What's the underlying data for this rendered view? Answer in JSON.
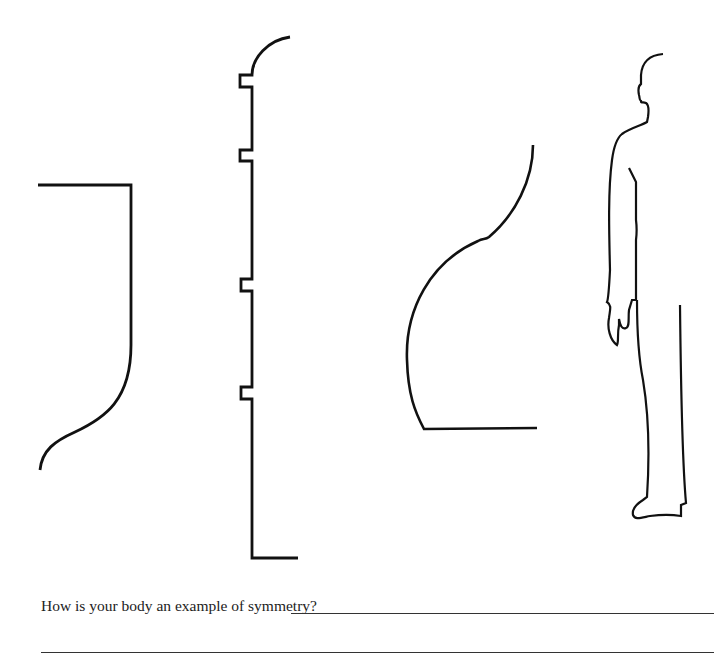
{
  "worksheet": {
    "question": "How is your body an example of symmetry?",
    "answer_lines": 2,
    "figures": [
      {
        "name": "half-shape-1",
        "description": "half of a curved S-shaped form"
      },
      {
        "name": "half-shape-2",
        "description": "half of a notched tall form with rounded top"
      },
      {
        "name": "half-shape-3",
        "description": "half of a curved vase-like form"
      },
      {
        "name": "half-body-profile",
        "description": "side profile outline of a standing person"
      }
    ],
    "colors": {
      "ink": "#111111",
      "paper": "#ffffff"
    }
  }
}
